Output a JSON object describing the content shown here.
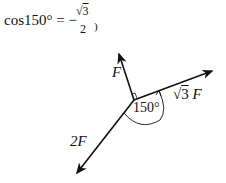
{
  "formula": {
    "lhs": "cos150° = −",
    "numerator_radical": "√",
    "numerator_value": "3",
    "denominator": "2",
    "trailing": ")"
  },
  "diagram": {
    "origin": [
      134,
      100
    ],
    "vectors": [
      {
        "name": "F",
        "label": "F",
        "tip": [
          119,
          52
        ]
      },
      {
        "name": "sqrt3F",
        "label_radical": "√",
        "label_value": "3",
        "label_var": "F",
        "tip": [
          214,
          70
        ]
      },
      {
        "name": "2F",
        "label": "2F",
        "tip": [
          75,
          175
        ]
      }
    ],
    "angle_label": "150°",
    "right_angle_marker": true,
    "stroke_color": "#111111"
  }
}
